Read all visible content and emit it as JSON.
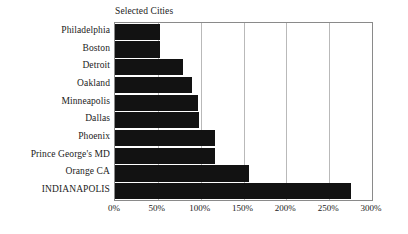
{
  "chart_data": {
    "type": "bar",
    "orientation": "horizontal",
    "title": "Selected Cities",
    "xlabel": "",
    "ylabel": "",
    "xlim": [
      0,
      300
    ],
    "xticks": [
      0,
      50,
      100,
      150,
      200,
      250,
      300
    ],
    "xtick_labels": [
      "0%",
      "50%",
      "100%",
      "150%",
      "200%",
      "250%",
      "300%"
    ],
    "grid": true,
    "legend": false,
    "bar_color": "#121212",
    "categories": [
      "Philadelphia",
      "Boston",
      "Detroit",
      "Oakland",
      "Minneapolis",
      "Dallas",
      "Phoenix",
      "Prince George's MD",
      "Orange CA",
      "INDIANAPOLIS"
    ],
    "values": [
      52,
      52,
      79,
      90,
      97,
      98,
      117,
      117,
      157,
      275
    ],
    "value_labels": [
      "52%",
      "52%",
      "79%",
      "90%",
      "97%",
      "98%",
      "117%",
      "117%",
      "157%",
      "275%"
    ]
  },
  "colors": {
    "bar": "#121212",
    "gridline": "#b9b9b9",
    "frame": "#8a8a8a",
    "text": "#1b1b1b",
    "background": "#ffffff"
  }
}
